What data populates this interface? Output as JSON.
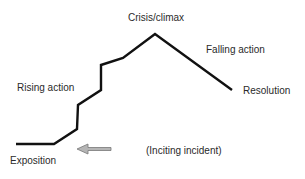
{
  "diagram": {
    "labels": {
      "crisis": "Crisis/climax",
      "falling": "Falling action",
      "rising": "Rising action",
      "resolution": "Resolution",
      "exposition": "Exposition",
      "inciting": "(Inciting incident)"
    },
    "plot_line_points": [
      [
        16,
        144
      ],
      [
        54,
        144
      ],
      [
        77,
        129
      ],
      [
        78,
        105
      ],
      [
        101,
        90
      ],
      [
        101,
        65
      ],
      [
        123,
        58
      ],
      [
        155,
        34
      ],
      [
        232,
        90
      ]
    ],
    "colors": {
      "line": "#111111",
      "arrow_fill": "#b5b5b5",
      "arrow_stroke": "#777777",
      "text": "#2a2a2a"
    }
  }
}
